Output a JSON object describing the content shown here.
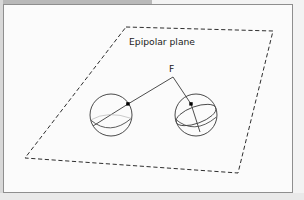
{
  "figure": {
    "domain": "diagram",
    "caption_labels": {
      "plane_label": "Epipolar plane",
      "focus_label": "F"
    },
    "colors": {
      "page_background": "#f3f3f3",
      "panel_background": "#fbfbfb",
      "panel_border": "#8e8e8e",
      "top_strip": "#b9b9b9",
      "stroke": "#3a3a3a",
      "sphere_stroke": "#4a4a4a",
      "dashed_stroke": "#2e2e2e",
      "point_fill": "#000000",
      "text": "#1b1b1b"
    },
    "panel": {
      "x": 3,
      "y": 4,
      "width": 290,
      "height": 189
    },
    "epipolar_plane": {
      "shape": "parallelogram",
      "style": "dashed",
      "points": [
        {
          "name": "top-left",
          "x": 122,
          "y": 22
        },
        {
          "name": "top-right",
          "x": 269,
          "y": 26
        },
        {
          "name": "bottom-right",
          "x": 234,
          "y": 168
        },
        {
          "name": "bottom-left",
          "x": 21,
          "y": 153
        }
      ]
    },
    "focus_point": {
      "x": 169,
      "y": 72
    },
    "label_positions": {
      "plane_label": {
        "x": 125,
        "y": 40
      },
      "focus_label": {
        "x": 166,
        "y": 66
      }
    },
    "spheres": [
      {
        "name": "left-sphere",
        "cx": 107,
        "cy": 110,
        "r": 21,
        "surface_point": {
          "x": 124,
          "y": 99
        },
        "ray_end": {
          "x": 89,
          "y": 121
        }
      },
      {
        "name": "right-sphere",
        "cx": 192,
        "cy": 110,
        "r": 21,
        "surface_point": {
          "x": 187,
          "y": 99
        },
        "ray_end": {
          "x": 196,
          "y": 127
        }
      }
    ]
  }
}
